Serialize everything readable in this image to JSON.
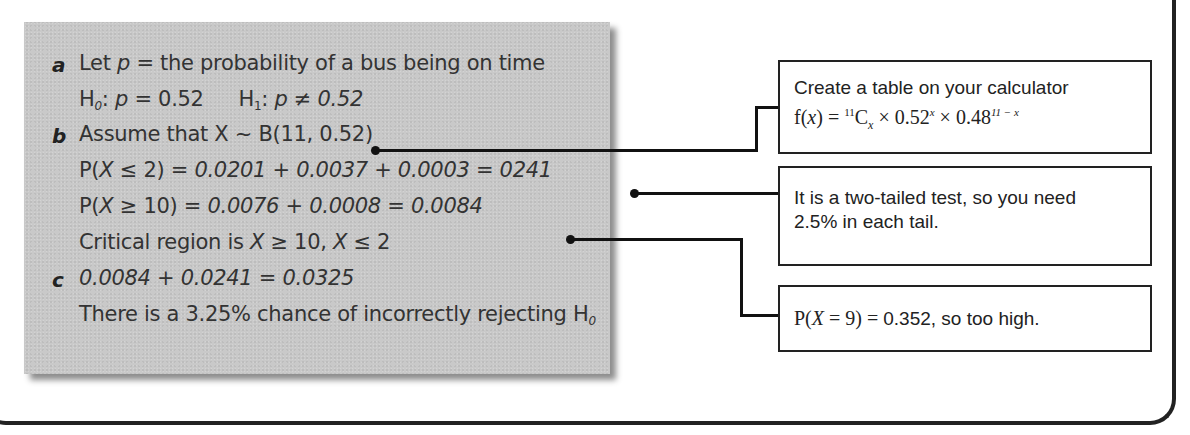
{
  "solution": {
    "parts": [
      {
        "label": "a",
        "lines": [
          "Let p = the probability of a bus being on time",
          "H0: p = 0.52    H1: p ≠ 0.52"
        ]
      },
      {
        "label": "b",
        "lines": [
          "Assume that X ~ B(11, 0.52)",
          "P(X ≤ 2) = 0.0201 + 0.0037 + 0.0003 = 0241",
          "P(X ≥ 10) = 0.0076 + 0.0008 = 0.0084",
          "Critical region is X ≥ 10, X ≤ 2"
        ]
      },
      {
        "label": "c",
        "lines": [
          "0.0084 + 0.0241 = 0.0325",
          "There is a 3.25% chance of incorrectly rejecting H0"
        ]
      }
    ],
    "a_label": "a",
    "b_label": "b",
    "c_label": "c",
    "line_a1_pre": "Let ",
    "line_a1_var": "p",
    "line_a1_post": " = the probability of a bus being on time",
    "h0_label": "H",
    "h0_sub": "0",
    "h0_eq": ": ",
    "h0_var": "p",
    "h0_val": " = 0.52",
    "h1_label": "H",
    "h1_sub": "1",
    "h1_eq": ": ",
    "h1_var": "p",
    "h1_val": " ≠ 0.52",
    "line_b1": "Assume that X ~ B(11, 0.52)",
    "line_b2_pre": "P(",
    "line_b2_var": "X",
    "line_b2_cond": " ≤ 2) = ",
    "line_b2_vals": "0.0201 + 0.0037 + 0.0003 = 0241",
    "line_b3_pre": "P(",
    "line_b3_var": "X",
    "line_b3_cond": " ≥ 10) = ",
    "line_b3_vals": "0.0076 + 0.0008 = 0.0084",
    "line_b4_pre": "Critical region is ",
    "line_b4_v1": "X",
    "line_b4_c1": " ≥ 10, ",
    "line_b4_v2": "X",
    "line_b4_c2": " ≤ 2",
    "line_c1": "0.0084 + 0.0241 = 0.0325",
    "line_c2_pre": "There is a 3.25% chance of incorrectly rejecting H",
    "line_c2_sub": "0"
  },
  "callouts": {
    "calculator": {
      "line1": "Create a table on your calculator",
      "formula_f": "f(",
      "formula_x": "x",
      "formula_eq": ") = ",
      "formula_sup11": "11",
      "formula_C": "C",
      "formula_subx": "x",
      "formula_mid": " × 0.52",
      "formula_supx": "x",
      "formula_mid2": " × 0.48",
      "formula_sup_exp": "11 − x"
    },
    "two_tailed": {
      "line1": "It is a two-tailed test, so you need",
      "line2": "2.5% in each tail."
    },
    "p9": {
      "pre": "P(",
      "var": "X",
      "mid": " = 9) = ",
      "post": "0.352, so too high."
    }
  }
}
